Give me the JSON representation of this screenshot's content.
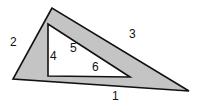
{
  "diagram": {
    "type": "geometry",
    "colors": {
      "background": "#ffffff",
      "frame_fill": "#c4c4c4",
      "inner_fill": "#ffffff",
      "stroke": "#111111"
    },
    "outer_triangle": {
      "points": [
        [
          52,
          8
        ],
        [
          13,
          79
        ],
        [
          189,
          91
        ]
      ]
    },
    "inner_triangle": {
      "points": [
        [
          48,
          24
        ],
        [
          48,
          76
        ],
        [
          130,
          77
        ]
      ]
    },
    "labels": [
      {
        "id": "1",
        "text": "1",
        "x": 112,
        "y": 100
      },
      {
        "id": "2",
        "text": "2",
        "x": 10,
        "y": 46
      },
      {
        "id": "3",
        "text": "3",
        "x": 129,
        "y": 38
      },
      {
        "id": "4",
        "text": "4",
        "x": 50,
        "y": 60
      },
      {
        "id": "5",
        "text": "5",
        "x": 70,
        "y": 52
      },
      {
        "id": "6",
        "text": "6",
        "x": 92,
        "y": 71
      }
    ]
  }
}
